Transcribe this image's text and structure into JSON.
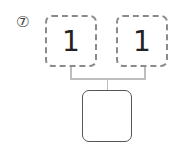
{
  "problem": {
    "number_label": "⑦",
    "top_left": {
      "value": "1"
    },
    "top_right": {
      "value": "1"
    },
    "bottom": {
      "value": ""
    }
  },
  "colors": {
    "dashed_border": "#8a8a8a",
    "solid_border": "#555555",
    "connector": "#bdbdbd"
  }
}
